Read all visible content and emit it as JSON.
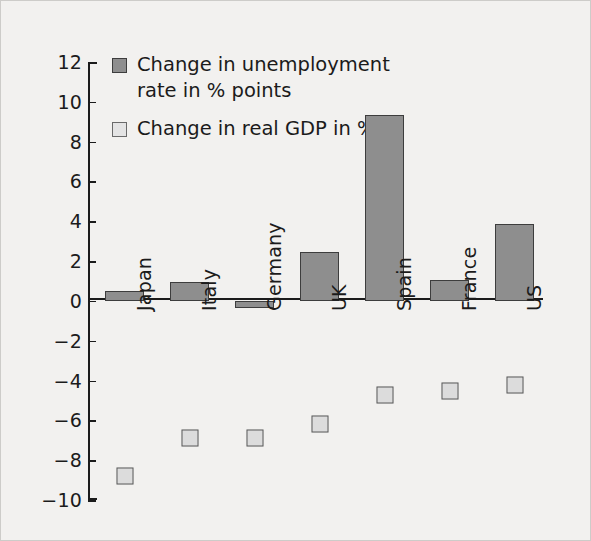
{
  "chart_data": {
    "type": "bar",
    "title": "",
    "xlabel": "",
    "ylabel": "",
    "ylim": [
      -10,
      12
    ],
    "ytick_step": 2,
    "yticks": [
      "12",
      "10",
      "8",
      "6",
      "4",
      "2",
      "0",
      "−2",
      "−4",
      "−6",
      "−8",
      "−10"
    ],
    "grid": false,
    "legend_position": "top-left-inside",
    "categories": [
      "Japan",
      "Italy",
      "Germany",
      "UK",
      "Spain",
      "France",
      "US"
    ],
    "series": [
      {
        "name": "Change in unemployment rate in % points",
        "marker": "bar",
        "color": "#8e8e8e",
        "edge_color": "#3d3d3d",
        "values": [
          0.5,
          0.95,
          -0.35,
          2.45,
          9.35,
          1.05,
          3.85
        ]
      },
      {
        "name": "Change in real GDP in %",
        "marker": "square",
        "color": "#dcdcdc",
        "edge_color": "#5a5a5a",
        "values": [
          -8.8,
          -6.9,
          -6.9,
          -6.2,
          -4.75,
          -4.5,
          -4.2
        ]
      }
    ]
  },
  "legend": {
    "entries": [
      {
        "icon": "filled-square-icon",
        "label": "Change in unemployment rate in % points"
      },
      {
        "icon": "outlined-square-icon",
        "label": "Change in real GDP in %"
      }
    ]
  },
  "colors": {
    "background": "#f2f1ef",
    "axis": "#1b1b1b",
    "bar_fill": "#8e8e8e",
    "bar_edge": "#3d3d3d",
    "marker_fill": "#dcdcdc",
    "marker_edge": "#5a5a5a"
  }
}
